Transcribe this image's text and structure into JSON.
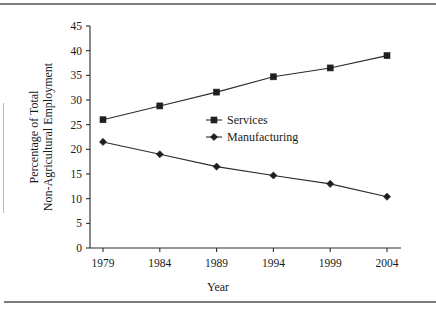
{
  "figure": {
    "has_top_rule": true,
    "has_bottom_rule": true,
    "has_left_rule": true
  },
  "chart_data": {
    "type": "line",
    "title": "",
    "subtitle": "",
    "xlabel": "Year",
    "ylabel": "Percentage of Total Non-Agricultural Employment",
    "ylabel_line1": "Percentage of Total",
    "ylabel_line2": "Non-Agricultural Employment",
    "categories": [
      "1979",
      "1984",
      "1989",
      "1994",
      "1999",
      "2004"
    ],
    "x": [
      1979,
      1984,
      1989,
      1994,
      1999,
      2004
    ],
    "xlim": [
      1979,
      2004
    ],
    "ylim": [
      0,
      45
    ],
    "yticks": [
      "0",
      "5",
      "10",
      "15",
      "20",
      "25",
      "30",
      "35",
      "40",
      "45"
    ],
    "ytick_values": [
      0,
      5,
      10,
      15,
      20,
      25,
      30,
      35,
      40,
      45
    ],
    "xticks": [
      "1979",
      "1984",
      "1989",
      "1994",
      "1999",
      "2004"
    ],
    "grid": false,
    "legend_position": "center-right",
    "series": [
      {
        "name": "Services",
        "marker": "square",
        "color": "#1f1f1f",
        "values": [
          26.0,
          28.8,
          31.6,
          34.7,
          36.5,
          39.0
        ]
      },
      {
        "name": "Manufacturing",
        "marker": "diamond",
        "color": "#1f1f1f",
        "values": [
          21.5,
          19.0,
          16.5,
          14.7,
          13.0,
          10.4
        ]
      }
    ]
  }
}
